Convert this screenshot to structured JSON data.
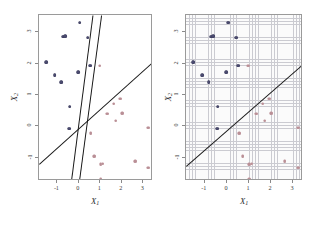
{
  "figure": {
    "background": "#ffffff",
    "panels": [
      {
        "id": "left",
        "name": "multiple-separating-hyperplanes",
        "grid": false,
        "x_axis_title": "X",
        "x_axis_subscript": "1",
        "y_axis_title": "X",
        "y_axis_subscript": "2",
        "x_ticks": [
          "-1",
          "0",
          "1",
          "2",
          "3"
        ],
        "y_ticks": [
          "3",
          "2",
          "1",
          "0",
          "-1"
        ]
      },
      {
        "id": "right",
        "name": "single-separating-hyperplane",
        "grid": true,
        "x_axis_title": "X",
        "x_axis_subscript": "1",
        "y_axis_title": "X",
        "y_axis_subscript": "2",
        "x_ticks": [
          "-1",
          "0",
          "1",
          "2",
          "3"
        ],
        "y_ticks": [
          "3",
          "2",
          "1",
          "0",
          "-1"
        ]
      }
    ],
    "colors": {
      "class_blue": "#4a4a6e",
      "class_red": "#b98f96",
      "hyperplane": "#1a1a1a",
      "grid": "#c9c9cf",
      "axis": "#9a9a9a"
    }
  },
  "chart_data": {
    "type": "scatter",
    "title": "",
    "xlabel": "X1",
    "ylabel": "X2",
    "xlim": [
      -1.85,
      3.45
    ],
    "ylim": [
      -1.75,
      3.55
    ],
    "xticks": [
      -1,
      0,
      1,
      2,
      3
    ],
    "yticks": [
      -1,
      0,
      1,
      2,
      3
    ],
    "grid": "left panel: none; right panel: fine light grid",
    "legend": "none",
    "series": [
      {
        "name": "class_blue",
        "color": "#4a4a6e",
        "points": [
          [
            0.05,
            3.3
          ],
          [
            -0.72,
            2.86
          ],
          [
            -0.62,
            2.88
          ],
          [
            0.42,
            2.83
          ],
          [
            -1.52,
            2.05
          ],
          [
            0.52,
            1.93
          ],
          [
            -1.12,
            1.62
          ],
          [
            -0.02,
            1.72
          ],
          [
            -0.82,
            1.4
          ],
          [
            -0.42,
            0.62
          ],
          [
            -0.45,
            -0.08
          ]
        ]
      },
      {
        "name": "class_red",
        "color": "#b98f96",
        "points": [
          [
            0.98,
            1.93
          ],
          [
            1.62,
            0.72
          ],
          [
            1.92,
            0.88
          ],
          [
            1.32,
            0.4
          ],
          [
            1.72,
            0.18
          ],
          [
            2.02,
            0.42
          ],
          [
            3.22,
            -0.05
          ],
          [
            0.55,
            -0.22
          ],
          [
            0.72,
            -0.95
          ],
          [
            1.02,
            -1.22
          ],
          [
            1.12,
            -1.2
          ],
          [
            2.62,
            -1.12
          ],
          [
            3.22,
            -1.32
          ],
          [
            1.02,
            -1.7
          ]
        ]
      }
    ],
    "lines": {
      "left_panel": [
        {
          "name": "hyperplane-1",
          "x1": -0.38,
          "y1": -1.75,
          "x2": 0.62,
          "y2": 3.55
        },
        {
          "name": "hyperplane-2",
          "x1": 0.02,
          "y1": -1.75,
          "x2": 1.05,
          "y2": 3.55
        },
        {
          "name": "hyperplane-3",
          "x1": -1.85,
          "y1": -1.22,
          "x2": 3.45,
          "y2": 2.05
        }
      ],
      "right_panel": [
        {
          "name": "hyperplane-1",
          "x1": -1.85,
          "y1": -1.28,
          "x2": 3.45,
          "y2": 1.98
        }
      ]
    }
  }
}
